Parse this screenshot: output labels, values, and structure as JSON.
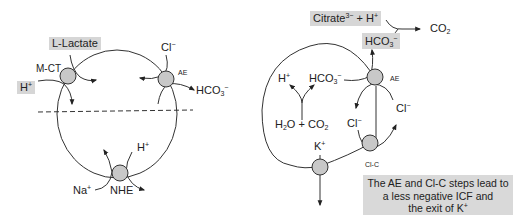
{
  "left_cell": {
    "transporters": [
      {
        "id": "mct",
        "label": "M-CT"
      },
      {
        "id": "ae",
        "label": "AE"
      },
      {
        "id": "nhe",
        "label": "NHE"
      }
    ],
    "labels": {
      "lactate": "L-Lactate",
      "h_in": "H",
      "h_in_sup": "+",
      "cl": "Cl",
      "cl_sup": "−",
      "hco3": "HCO",
      "hco3_sub": "3",
      "hco3_sup": "−",
      "h_nhe": "H",
      "h_nhe_sup": "+",
      "na": "Na",
      "na_sup": "+"
    }
  },
  "right_cell": {
    "transporters": [
      {
        "id": "ae",
        "label": "AE"
      },
      {
        "id": "clc",
        "label": "Cl-C"
      },
      {
        "id": "k-channel",
        "label": ""
      }
    ],
    "labels": {
      "citrate": "Citrate",
      "citrate_sup": "3−",
      "plus_h": " + H",
      "plus_h_sup": "+",
      "co2_out": "CO",
      "co2_out_sub": "2",
      "hco3_box": "HCO",
      "hco3_box_sub": "3",
      "hco3_box_sup": "−",
      "h": "H",
      "h_sup": "+",
      "hco3_in": "HCO",
      "hco3_in_sub": "3",
      "hco3_in_sup": "−",
      "h2o": "H",
      "h2o_sub": "2",
      "h2o_rest": "O + CO",
      "h2o_co2_sub": "2",
      "cl_left": "Cl",
      "cl_left_sup": "−",
      "cl_right": "Cl",
      "cl_right_sup": "−",
      "k": "K",
      "k_sup": "+"
    },
    "note": {
      "line1": "The AE and Cl-C steps lead to",
      "line2": "a less negative ICF and",
      "line3": "the exit of K",
      "line3_sup": "+"
    }
  },
  "colors": {
    "transporter_fill": "#c8c8c8",
    "label_box": "#d6d6d6",
    "stroke": "#333333"
  }
}
